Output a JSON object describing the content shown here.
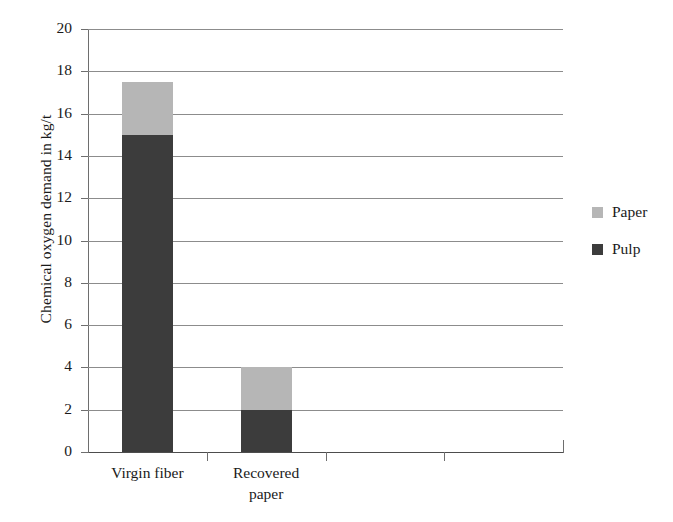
{
  "chart_data": {
    "type": "bar",
    "subtype": "stacked-bar",
    "title": "",
    "xlabel": "",
    "ylabel": "Chemical oxygen demand in kg/t",
    "categories": [
      "Virgin fiber",
      "Recovered paper",
      "",
      ""
    ],
    "series": [
      {
        "name": "Pulp",
        "values": [
          15,
          2,
          null,
          null
        ],
        "color": "#3c3c3c"
      },
      {
        "name": "Paper",
        "values": [
          2.5,
          2,
          null,
          null
        ],
        "color": "#b6b6b6"
      }
    ],
    "stack_order": [
      "Pulp",
      "Paper"
    ],
    "totals": [
      17.5,
      4,
      null,
      null
    ],
    "ylim": [
      0,
      20
    ],
    "ytick_step": 2,
    "yticks": [
      20,
      18,
      16,
      14,
      12,
      10,
      8,
      6,
      4,
      2,
      0
    ],
    "ytick_labels": [
      "20",
      "18",
      "16",
      "14",
      "12",
      "10",
      "8",
      "6",
      "4",
      "2",
      "0"
    ],
    "xtick_labels": [
      [
        "Virgin fiber"
      ],
      [
        "Recovered",
        "paper"
      ],
      [
        ""
      ],
      [
        ""
      ]
    ],
    "grid": {
      "horizontal": true,
      "vertical": false,
      "color": "#8c8c8c"
    },
    "legend": {
      "position": "right",
      "entries": [
        {
          "label": "Paper",
          "color": "#b6b6b6"
        },
        {
          "label": "Pulp",
          "color": "#3c3c3c"
        }
      ]
    }
  },
  "colors": {
    "paper": "#b6b6b6",
    "pulp": "#3c3c3c",
    "gridline": "#8c8c8c",
    "axis": "#4d4d4d",
    "text": "#1a1a1a",
    "background": "#ffffff"
  }
}
